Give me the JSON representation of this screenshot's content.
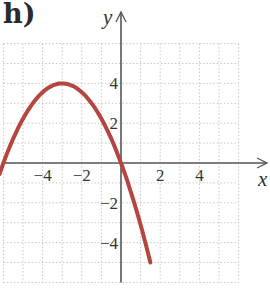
{
  "panel_label": "h)",
  "colors": {
    "curve": "#b5453f",
    "axis": "#555555",
    "grid": "#c8c8c8",
    "text": "#333333"
  },
  "chart_data": {
    "type": "line",
    "title": "h)",
    "xlabel": "x",
    "ylabel": "y",
    "xlim": [
      -6,
      6
    ],
    "ylim": [
      -6,
      6
    ],
    "grid": true,
    "grid_step": 1,
    "x_ticks": [
      -4,
      -2,
      2,
      4
    ],
    "x_tick_labels": [
      "−4",
      "−2",
      "2",
      "4"
    ],
    "y_ticks": [
      4,
      2,
      -2,
      -4
    ],
    "y_tick_labels": [
      "4",
      "2",
      "−2",
      "−4"
    ],
    "series": [
      {
        "name": "parabola",
        "description": "Downward-opening parabola with vertex (-3, 4), x-intercepts at -6 and 0",
        "x": [
          -6.2,
          -6,
          -5,
          -4,
          -3,
          -2,
          -1,
          0,
          0.5,
          1,
          1.5
        ],
        "y": [
          -0.55,
          0,
          2.22,
          3.56,
          4,
          3.56,
          2.22,
          0,
          -1.44,
          -3.11,
          -5.0
        ]
      }
    ]
  }
}
